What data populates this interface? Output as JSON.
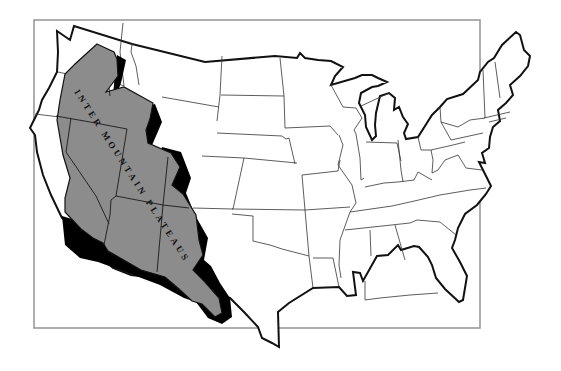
{
  "map": {
    "title": "",
    "subject": "Contiguous United States",
    "region_label": "INTER MOUNTAIN PLATEAUS",
    "colors": {
      "background": "#ffffff",
      "frame": "#9a9a9a",
      "nation_outline": "#111111",
      "state_border": "#333333",
      "region_fill": "#8c8c8c",
      "region_shadow": "#000000"
    },
    "frame": {
      "x": 34,
      "y": 20,
      "width": 446,
      "height": 308
    },
    "highlighted_region": {
      "name": "Intermountain Plateaus",
      "style": "gray fill with black drop-shadow (3D relief)"
    }
  }
}
